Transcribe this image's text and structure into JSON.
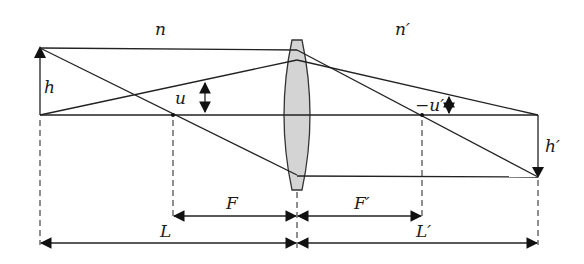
{
  "diagram": {
    "type": "thin-lens imaging geometry",
    "labels": {
      "object_medium_index": "n",
      "image_medium_index": "n′",
      "object_height": "h",
      "image_height": "h′",
      "object_angle": "u",
      "image_angle": "−u′",
      "front_focal_length": "F",
      "back_focal_length": "F′",
      "object_distance": "L",
      "image_distance": "L′"
    },
    "colors": {
      "lens_fill": "#d4d4d4",
      "stroke": "#222222"
    }
  }
}
